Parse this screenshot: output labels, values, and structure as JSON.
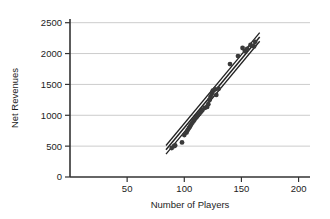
{
  "chart_data": {
    "type": "scatter",
    "title": "",
    "xlabel": "Number of Players",
    "ylabel": "Net Revenues",
    "xlim": [
      0,
      210
    ],
    "ylim": [
      0,
      2560
    ],
    "xticks": [
      50,
      100,
      150,
      200
    ],
    "yticks": [
      0,
      500,
      1000,
      1500,
      2000,
      2500
    ],
    "grid": "horizontal",
    "legend": "none",
    "point_color": "#3a3a3a",
    "line_color": "#222222",
    "grid_color": "#cccccc",
    "axis_color": "#333333",
    "points": [
      {
        "x": 89,
        "y": 470
      },
      {
        "x": 91,
        "y": 500
      },
      {
        "x": 92,
        "y": 510
      },
      {
        "x": 98,
        "y": 560
      },
      {
        "x": 100,
        "y": 680
      },
      {
        "x": 102,
        "y": 720
      },
      {
        "x": 103,
        "y": 760
      },
      {
        "x": 104,
        "y": 790
      },
      {
        "x": 105,
        "y": 820
      },
      {
        "x": 106,
        "y": 850
      },
      {
        "x": 107,
        "y": 880
      },
      {
        "x": 108,
        "y": 905
      },
      {
        "x": 109,
        "y": 930
      },
      {
        "x": 110,
        "y": 955
      },
      {
        "x": 111,
        "y": 975
      },
      {
        "x": 112,
        "y": 1000
      },
      {
        "x": 113,
        "y": 1020
      },
      {
        "x": 114,
        "y": 1045
      },
      {
        "x": 115,
        "y": 1065
      },
      {
        "x": 116,
        "y": 1090
      },
      {
        "x": 118,
        "y": 1120
      },
      {
        "x": 120,
        "y": 1135
      },
      {
        "x": 121,
        "y": 1180
      },
      {
        "x": 122,
        "y": 1245
      },
      {
        "x": 123,
        "y": 1300
      },
      {
        "x": 124,
        "y": 1345
      },
      {
        "x": 125,
        "y": 1400
      },
      {
        "x": 127,
        "y": 1420
      },
      {
        "x": 128,
        "y": 1330
      },
      {
        "x": 130,
        "y": 1430
      },
      {
        "x": 140,
        "y": 1830
      },
      {
        "x": 147,
        "y": 1960
      },
      {
        "x": 151,
        "y": 2090
      },
      {
        "x": 153,
        "y": 2040
      },
      {
        "x": 155,
        "y": 2075
      },
      {
        "x": 158,
        "y": 2140
      },
      {
        "x": 161,
        "y": 2115
      },
      {
        "x": 162,
        "y": 2190
      }
    ],
    "fit_line": {
      "name": "regression-line",
      "x_start": 84,
      "y_start": 440,
      "x_end": 166,
      "y_end": 2270
    },
    "confidence_bands": {
      "name": "confidence-band",
      "offset_upper": 70,
      "offset_lower": -70
    }
  }
}
